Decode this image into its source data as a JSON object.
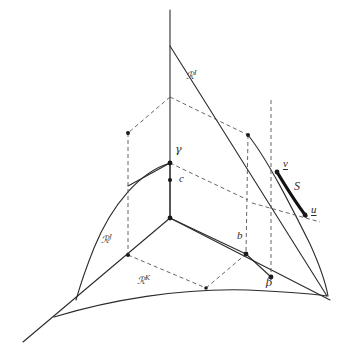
{
  "figure": {
    "kind": "geometric-diagram",
    "background_color": "#ffffff",
    "line_color": "#2b2b2b",
    "dash_color": "#555555",
    "bold_color": "#111111"
  },
  "labels": {
    "region_i": {
      "base": "ℛ",
      "sup": "I",
      "x": 188,
      "y": 76
    },
    "region_j": {
      "base": "ℛ",
      "sup": "J",
      "x": 104,
      "y": 240
    },
    "region_k": {
      "base": "ℛ",
      "sup": "K",
      "x": 140,
      "y": 281
    },
    "gamma": {
      "text": "γ",
      "x": 172,
      "y": 146
    },
    "c": {
      "text": "c",
      "x": 180,
      "y": 175
    },
    "b": {
      "text": "b",
      "x": 238,
      "y": 232
    },
    "beta": {
      "text": "β",
      "x": 268,
      "y": 280
    },
    "v": {
      "text": "v",
      "x": 284,
      "y": 162
    },
    "u": {
      "text": "u",
      "x": 312,
      "y": 208
    },
    "S": {
      "text": "S",
      "x": 296,
      "y": 186
    }
  },
  "points": {
    "apex_top": {
      "x": 170,
      "y": 97
    },
    "vertex_gamma": {
      "x": 170,
      "y": 163
    },
    "point_c": {
      "x": 170,
      "y": 180
    },
    "origin": {
      "x": 170,
      "y": 218
    },
    "left_box_top": {
      "x": 128,
      "y": 133
    },
    "left_box_bottom": {
      "x": 128,
      "y": 255
    },
    "right_box_top": {
      "x": 248,
      "y": 135
    },
    "point_b": {
      "x": 246,
      "y": 254
    },
    "point_beta": {
      "x": 271,
      "y": 277
    },
    "point_v": {
      "x": 277,
      "y": 172
    },
    "point_u": {
      "x": 305,
      "y": 215
    },
    "base_mid": {
      "x": 206,
      "y": 285
    }
  }
}
